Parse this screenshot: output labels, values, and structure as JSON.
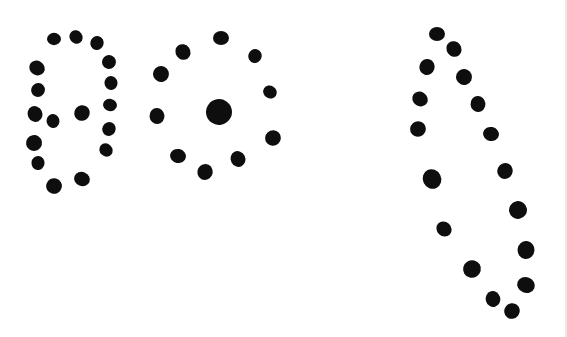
{
  "canvas": {
    "width": 567,
    "height": 337,
    "background_color": "#ffffff",
    "dot_color": "#0e0e0e"
  },
  "motifs": [
    {
      "id": "oval-with-inner-dots",
      "dots": [
        {
          "x": 54,
          "y": 39,
          "r": 7
        },
        {
          "x": 76,
          "y": 37,
          "r": 7
        },
        {
          "x": 97,
          "y": 43,
          "r": 7
        },
        {
          "x": 109,
          "y": 62,
          "r": 7
        },
        {
          "x": 37,
          "y": 68,
          "r": 8
        },
        {
          "x": 111,
          "y": 83,
          "r": 7
        },
        {
          "x": 38,
          "y": 90,
          "r": 7
        },
        {
          "x": 110,
          "y": 105,
          "r": 7
        },
        {
          "x": 35,
          "y": 114,
          "r": 8
        },
        {
          "x": 109,
          "y": 129,
          "r": 7
        },
        {
          "x": 34,
          "y": 143,
          "r": 8
        },
        {
          "x": 106,
          "y": 150,
          "r": 7
        },
        {
          "x": 38,
          "y": 163,
          "r": 7
        },
        {
          "x": 54,
          "y": 186,
          "r": 8
        },
        {
          "x": 82,
          "y": 179,
          "r": 8
        },
        {
          "x": 53,
          "y": 121,
          "r": 7
        },
        {
          "x": 82,
          "y": 113,
          "r": 8
        }
      ]
    },
    {
      "id": "ring-with-center-dot",
      "dots": [
        {
          "x": 221,
          "y": 38,
          "r": 8
        },
        {
          "x": 183,
          "y": 52,
          "r": 8
        },
        {
          "x": 255,
          "y": 56,
          "r": 7
        },
        {
          "x": 161,
          "y": 74,
          "r": 8
        },
        {
          "x": 270,
          "y": 92,
          "r": 7
        },
        {
          "x": 157,
          "y": 116,
          "r": 8
        },
        {
          "x": 273,
          "y": 138,
          "r": 8
        },
        {
          "x": 178,
          "y": 156,
          "r": 8
        },
        {
          "x": 238,
          "y": 159,
          "r": 8
        },
        {
          "x": 205,
          "y": 172,
          "r": 8
        },
        {
          "x": 219,
          "y": 112,
          "r": 13
        }
      ]
    },
    {
      "id": "elongated-loop",
      "dots": [
        {
          "x": 437,
          "y": 34,
          "r": 8
        },
        {
          "x": 454,
          "y": 49,
          "r": 8
        },
        {
          "x": 427,
          "y": 67,
          "r": 8
        },
        {
          "x": 464,
          "y": 77,
          "r": 8
        },
        {
          "x": 420,
          "y": 99,
          "r": 8
        },
        {
          "x": 478,
          "y": 104,
          "r": 8
        },
        {
          "x": 418,
          "y": 129,
          "r": 8
        },
        {
          "x": 491,
          "y": 134,
          "r": 8
        },
        {
          "x": 432,
          "y": 179,
          "r": 10
        },
        {
          "x": 505,
          "y": 171,
          "r": 8
        },
        {
          "x": 518,
          "y": 210,
          "r": 9
        },
        {
          "x": 444,
          "y": 229,
          "r": 8
        },
        {
          "x": 526,
          "y": 250,
          "r": 9
        },
        {
          "x": 472,
          "y": 269,
          "r": 9
        },
        {
          "x": 526,
          "y": 285,
          "r": 9
        },
        {
          "x": 493,
          "y": 299,
          "r": 8
        },
        {
          "x": 512,
          "y": 311,
          "r": 8
        }
      ]
    }
  ]
}
